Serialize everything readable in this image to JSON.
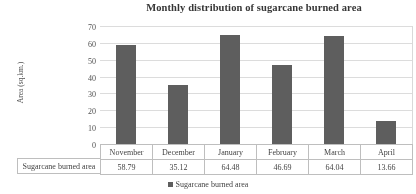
{
  "chart_data": {
    "type": "bar",
    "title": "Monthly distribution of sugarcane burned area",
    "xlabel": "",
    "ylabel": "Area (sq.km.)",
    "categories": [
      "November",
      "December",
      "January",
      "February",
      "March",
      "April"
    ],
    "values": [
      58.79,
      35.12,
      64.48,
      46.69,
      64.04,
      13.66
    ],
    "series": [
      {
        "name": "Sugarcane burned area",
        "values": [
          58.79,
          35.12,
          64.48,
          46.69,
          64.04,
          13.66
        ]
      }
    ],
    "ylim": [
      0,
      70
    ],
    "yticks": [
      0,
      10,
      20,
      30,
      40,
      50,
      60,
      70
    ],
    "ytick_labels": [
      "0",
      "10",
      "20",
      "30",
      "40",
      "50",
      "60",
      "70"
    ],
    "grid": true,
    "legend_position": "bottom",
    "legend_entries": [
      "Sugarcane burned area"
    ],
    "data_table": {
      "row_label": "Sugarcane burned area",
      "headers": [
        "November",
        "December",
        "January",
        "February",
        "March",
        "April"
      ],
      "cells": [
        "58.79",
        "35.12",
        "64.48",
        "46.69",
        "64.04",
        "13.66"
      ]
    },
    "bar_color": "#595959",
    "gridline_color": "#dcdcdc"
  }
}
